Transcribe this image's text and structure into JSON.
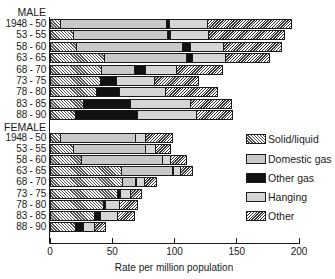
{
  "chart_data": {
    "type": "bar",
    "orientation": "horizontal",
    "stacked": true,
    "title": "",
    "xlabel": "Rate per million population",
    "ylabel": "",
    "xlim": [
      0,
      200
    ],
    "xticks": [
      0,
      50,
      100,
      150,
      200
    ],
    "grid": false,
    "legend_position": "right",
    "series_names": [
      "Solid/liquid",
      "Domestic gas",
      "Other gas",
      "Hanging",
      "Other"
    ],
    "groups": [
      {
        "name": "MALE",
        "categories": [
          "1948 - 50",
          "53 - 55",
          "58 - 60",
          "63 - 65",
          "68 - 70",
          "73 - 75",
          "78 - 80",
          "83 - 85",
          "88 - 90"
        ],
        "series": [
          {
            "name": "Solid/liquid",
            "values": [
              9,
              19,
              22,
              44,
              42,
              41,
              38,
              27,
              21
            ]
          },
          {
            "name": "Domestic gas",
            "values": [
              85,
              76,
              85,
              66,
              26,
              0,
              0,
              0,
              0
            ]
          },
          {
            "name": "Other gas",
            "values": [
              2,
              2,
              6,
              5,
              9,
              13,
              18,
              38,
              50
            ]
          },
          {
            "name": "Hanging",
            "values": [
              31,
              31,
              27,
              26,
              25,
              30,
              37,
              48,
              47
            ]
          },
          {
            "name": "Other",
            "values": [
              67,
              61,
              46,
              36,
              37,
              36,
              42,
              33,
              29
            ]
          }
        ]
      },
      {
        "name": "FEMALE",
        "categories": [
          "1948 - 50",
          "53 - 55",
          "58 - 60",
          "63 - 65",
          "68 - 70",
          "73 - 75",
          "78 - 80",
          "83 - 85",
          "88 - 90"
        ],
        "series": [
          {
            "name": "Solid/liquid",
            "values": [
              9,
              19,
              26,
              58,
              59,
              55,
              43,
              36,
              21
            ]
          },
          {
            "name": "Domestic gas",
            "values": [
              60,
              58,
              65,
              41,
              10,
              0,
              0,
              0,
              0
            ]
          },
          {
            "name": "Other gas",
            "values": [
              0,
              0,
              0,
              1,
              1,
              2,
              2,
              5,
              6
            ]
          },
          {
            "name": "Hanging",
            "values": [
              8,
              8,
              6,
              5,
              6,
              8,
              11,
              14,
              9
            ]
          },
          {
            "name": "Other",
            "values": [
              22,
              12,
              13,
              10,
              10,
              9,
              15,
              13,
              9
            ]
          }
        ]
      }
    ]
  },
  "legend": [
    {
      "label": "Solid/liquid",
      "pattern": "solid"
    },
    {
      "label": "Domestic gas",
      "pattern": "domestic"
    },
    {
      "label": "Other gas",
      "pattern": "othergas"
    },
    {
      "label": "Hanging",
      "pattern": "hanging"
    },
    {
      "label": "Other",
      "pattern": "other"
    }
  ],
  "axis": {
    "title": "Rate per million population",
    "ticks": [
      "0",
      "50",
      "100",
      "150",
      "200"
    ]
  }
}
